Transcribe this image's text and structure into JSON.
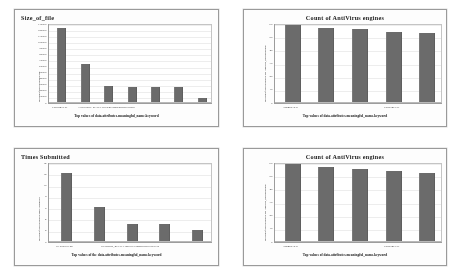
{
  "page": {
    "background": "#ffffff",
    "layout": "2x2 grid of bar chart panels",
    "bar_color": "#6b6b6b",
    "panel_border_color": "#9a9a9a"
  },
  "panels": [
    {
      "id": "size-of-file",
      "title_align": "left",
      "chart_data": {
        "type": "bar",
        "title": "Size_of_file",
        "xlabel": "Top values of data.attributes.meaningful_name.keyword",
        "ylabel": "Median of data.attributes.size",
        "categories": [
          "CardDhx.exe",
          "",
          "Flood Beer_4CTx.LOcDr4P3bmtcuncts7Se8Sld",
          "",
          "",
          "",
          ""
        ],
        "values": [
          122000,
          62000,
          27000,
          25000,
          25000,
          24000,
          6000
        ],
        "ytick_labels": [
          "0",
          "10000",
          "20000",
          "30000",
          "40000",
          "50000",
          "60000",
          "70000",
          "80000",
          "90000",
          "100000",
          "110000",
          "120000",
          "130000"
        ],
        "ylim": [
          0,
          130000
        ],
        "grid": true,
        "legend": "none"
      }
    },
    {
      "id": "count-of-antivirus-engines-top",
      "title_align": "center",
      "chart_data": {
        "type": "bar",
        "title": "Count of AntiVirus engines",
        "xlabel": "Top values of data.attributes.meaningful_name.keyword",
        "ylabel": "Median of data.attributes.last_analysis_stats.malicious",
        "categories": [
          "abbmtx15.zl",
          "",
          "",
          "CardDhx.exe",
          ""
        ],
        "values": [
          63,
          61,
          60,
          58,
          57
        ],
        "ytick_labels": [
          "0",
          "10",
          "20",
          "30",
          "40",
          "50",
          "60"
        ],
        "ylim": [
          0,
          65
        ],
        "grid": true,
        "legend": "none"
      }
    },
    {
      "id": "times-submitted",
      "title_align": "left",
      "chart_data": {
        "type": "bar",
        "title": "Times Submitted",
        "xlabel": "Top values of the data.attributes.meaningful_name.keyword",
        "ylabel": "Median of data.attributes.times_submitted",
        "categories": [
          "16-0000.03.45",
          "",
          "Ito odbara_4CTx1.LBoDoC39bbnxbccb7xzbYcB",
          "",
          ""
        ],
        "values": [
          12,
          6,
          3,
          3,
          2
        ],
        "ytick_labels": [
          "0",
          "2",
          "4",
          "6",
          "8",
          "10",
          "12",
          "14"
        ],
        "ylim": [
          0,
          14
        ],
        "grid": true,
        "legend": "none"
      }
    },
    {
      "id": "count-of-antivirus-engines-bottom",
      "title_align": "center",
      "chart_data": {
        "type": "bar",
        "title": "Count of AntiVirus engines",
        "xlabel": "Top values of data.attributes.meaningful_name.keyword",
        "ylabel": "Median of data.attributes.last_analysis_stats.malicious",
        "categories": [
          "abbmtx15.zl",
          "",
          "",
          "CardDhx.exe",
          ""
        ],
        "values": [
          63,
          61,
          59,
          58,
          56
        ],
        "ytick_labels": [
          "0",
          "10",
          "20",
          "30",
          "40",
          "50",
          "60"
        ],
        "ylim": [
          0,
          65
        ],
        "grid": true,
        "legend": "none"
      }
    }
  ]
}
